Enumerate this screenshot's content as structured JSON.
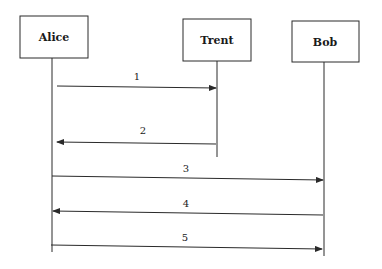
{
  "diagram": {
    "type": "sequence",
    "actors": [
      {
        "id": "alice",
        "label": "Alice",
        "box": {
          "x": 20,
          "y": 16,
          "w": 68,
          "h": 42
        },
        "lifeline": {
          "x": 52,
          "y1": 58,
          "y2": 252
        }
      },
      {
        "id": "trent",
        "label": "Trent",
        "box": {
          "x": 183,
          "y": 19,
          "w": 68,
          "h": 42
        },
        "lifeline": {
          "x": 217,
          "y1": 61,
          "y2": 157
        }
      },
      {
        "id": "bob",
        "label": "Bob",
        "box": {
          "x": 292,
          "y": 21,
          "w": 67,
          "h": 41
        },
        "lifeline": {
          "x": 324,
          "y1": 62,
          "y2": 256
        }
      }
    ],
    "messages": [
      {
        "label": "1",
        "from": "Alice",
        "to": "Trent",
        "y": 87
      },
      {
        "label": "2",
        "from": "Trent",
        "to": "Alice",
        "y": 143
      },
      {
        "label": "3",
        "from": "Alice",
        "to": "Bob",
        "y": 178
      },
      {
        "label": "4",
        "from": "Bob",
        "to": "Alice",
        "y": 213
      },
      {
        "label": "5",
        "from": "Alice",
        "to": "Bob",
        "y": 247
      }
    ],
    "colors": {
      "ink": "#2a2a2a",
      "background": "#ffffff"
    }
  }
}
